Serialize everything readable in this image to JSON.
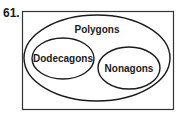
{
  "problem": {
    "number": "61."
  },
  "diagram": {
    "type": "venn",
    "outer": {
      "label": "Polygons"
    },
    "sets": [
      {
        "label": "Dodecagons"
      },
      {
        "label": "Nonagons"
      }
    ],
    "stroke_color": "#1a1a1a",
    "background_color": "#ffffff"
  }
}
